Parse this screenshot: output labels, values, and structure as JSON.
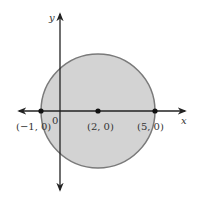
{
  "diagram": {
    "type": "circle-on-coordinate-plane",
    "axes": {
      "x_label": "x",
      "y_label": "y",
      "origin_label": "0"
    },
    "circle": {
      "center": [
        2,
        0
      ],
      "radius": 3,
      "fill_color": "#d3d3d3",
      "stroke_color": "#7a7a7a"
    },
    "points": [
      {
        "label": "(−1, 0)",
        "x": -1,
        "y": 0
      },
      {
        "label": "(2, 0)",
        "x": 2,
        "y": 0
      },
      {
        "label": "(5, 0)",
        "x": 5,
        "y": 0
      }
    ],
    "colors": {
      "axis": "#222222",
      "point": "#111111"
    }
  }
}
